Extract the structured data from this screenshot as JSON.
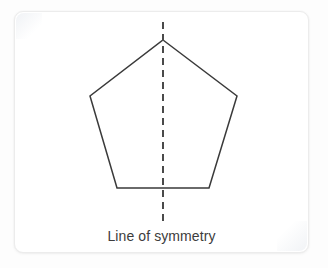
{
  "canvas": {
    "width": 328,
    "height": 268,
    "background_color": "#fdfdfd"
  },
  "card": {
    "name": "figure-card",
    "background_color": "#ffffff",
    "border_color": "#ececec",
    "corner_radius_px": 9,
    "bounds": {
      "x": 14,
      "y": 11,
      "width": 295,
      "height": 242
    }
  },
  "figure": {
    "shape_name": "regular-pentagon",
    "stroke_color": "#3a3a3a",
    "stroke_width_px": 1.5,
    "fill": "none",
    "vertices": [
      {
        "label": "apex",
        "x": 163,
        "y": 40
      },
      {
        "label": "upper-right",
        "x": 237,
        "y": 96
      },
      {
        "label": "lower-right",
        "x": 209,
        "y": 188
      },
      {
        "label": "lower-left",
        "x": 117,
        "y": 188
      },
      {
        "label": "upper-left",
        "x": 90,
        "y": 96
      }
    ],
    "symmetry_line": {
      "name": "line-of-symmetry",
      "orientation": "vertical",
      "x": 163,
      "y_start": 22,
      "y_end": 222,
      "stroke_color": "#4a4a4a",
      "stroke_width_px": 2,
      "dash_length_px": 7,
      "gap_length_px": 5
    }
  },
  "caption": {
    "text": "Line of symmetry",
    "color": "#3c3c3c",
    "font_size_px": 14,
    "align": "center"
  }
}
